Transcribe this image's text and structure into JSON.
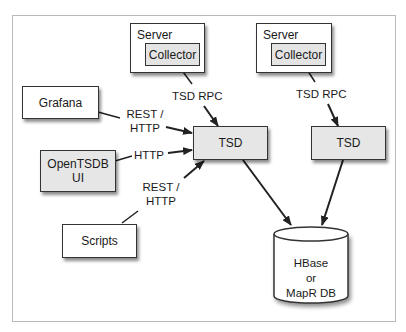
{
  "diagram": {
    "nodes": {
      "server_1": {
        "label": "Server",
        "child": "Collector"
      },
      "server_2": {
        "label": "Server",
        "child": "Collector"
      },
      "grafana": {
        "label": "Grafana"
      },
      "opentsdb_ui": {
        "line1": "OpenTSDB",
        "line2": "UI"
      },
      "scripts": {
        "label": "Scripts"
      },
      "tsd_1": {
        "label": "TSD"
      },
      "tsd_2": {
        "label": "TSD"
      },
      "database": {
        "line1": "HBase",
        "line2": "or",
        "line3": "MapR DB"
      }
    },
    "edges": [
      {
        "from": "Collector (Server 1)",
        "to": "TSD 1",
        "label": "TSD RPC"
      },
      {
        "from": "Collector (Server 2)",
        "to": "TSD 2",
        "label": "TSD RPC"
      },
      {
        "from": "Grafana",
        "to": "TSD 1",
        "label_line1": "REST /",
        "label_line2": "HTTP"
      },
      {
        "from": "OpenTSDB UI",
        "to": "TSD 1",
        "label": "HTTP"
      },
      {
        "from": "Scripts",
        "to": "TSD 1",
        "label_line1": "REST /",
        "label_line2": "HTTP"
      },
      {
        "from": "TSD 1",
        "to": "HBase or MapR DB",
        "label": ""
      },
      {
        "from": "TSD 2",
        "to": "HBase or MapR DB",
        "label": ""
      }
    ],
    "colors": {
      "box_fill": "#ffffff",
      "tsd_fill": "#e6e6e6",
      "stroke": "#333333",
      "frame": "#b9b9b9"
    }
  }
}
